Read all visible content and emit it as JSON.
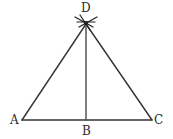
{
  "figure": {
    "background_color": "#ffffff",
    "stroke_color": "#333333",
    "label_color": "#2b2b2b",
    "width": 173,
    "height": 139,
    "labels": {
      "apex": "D",
      "left_vertex": "A",
      "foot": "B",
      "right_vertex": "C"
    },
    "points": {
      "D": {
        "x": 86,
        "y": 24
      },
      "A": {
        "x": 22,
        "y": 120
      },
      "B": {
        "x": 86,
        "y": 120
      },
      "C": {
        "x": 152,
        "y": 120
      }
    },
    "segments": [
      {
        "name": "AD",
        "from": "A",
        "to": "D"
      },
      {
        "name": "DC",
        "from": "D",
        "to": "C"
      },
      {
        "name": "AC",
        "from": "A",
        "to": "C"
      },
      {
        "name": "DB",
        "from": "D",
        "to": "B"
      }
    ],
    "construction_marks": {
      "name": "arc-intersection-marks",
      "at": "D",
      "count": 4,
      "description": "crossing compass arc strokes forming an X at the apex"
    }
  }
}
